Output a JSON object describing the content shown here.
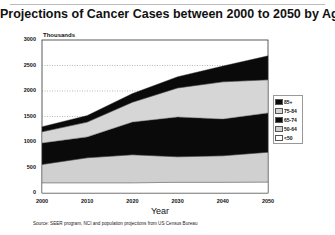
{
  "chart_data": {
    "type": "area",
    "stacked": true,
    "title": "Projections of Cancer Cases between 2000 to 2050 by Age",
    "unit_label": "Thousands",
    "xlabel": "Year",
    "ylabel": "",
    "x": [
      2000,
      2010,
      2020,
      2030,
      2040,
      2050
    ],
    "x_ticks": [
      "2000",
      "2010",
      "2020",
      "2030",
      "2040",
      "2050"
    ],
    "y_ticks": [
      "0",
      "500",
      "1000",
      "1500",
      "2000",
      "2500",
      "3000"
    ],
    "ylim": [
      0,
      3000
    ],
    "grid": "horizontal dotted",
    "legend_position": "right",
    "series": [
      {
        "name": "<50",
        "color": "#ffffff",
        "values": [
          200,
          200,
          200,
          210,
          210,
          215
        ]
      },
      {
        "name": "50-64",
        "color": "#d0d0d0",
        "values": [
          360,
          490,
          550,
          500,
          520,
          585
        ]
      },
      {
        "name": "65-74",
        "color": "#0a0a0a",
        "values": [
          420,
          410,
          640,
          780,
          720,
          770
        ]
      },
      {
        "name": "75-84",
        "color": "#d6d6d6",
        "values": [
          220,
          290,
          390,
          570,
          730,
          650
        ]
      },
      {
        "name": "85+",
        "color": "#0a0a0a",
        "values": [
          100,
          130,
          170,
          220,
          310,
          470
        ]
      }
    ],
    "legend_order": [
      "85+",
      "75-84",
      "65-74",
      "50-64",
      "<50"
    ]
  },
  "source": "Source: SEER program, NCI and population projections from US Census Bureau"
}
